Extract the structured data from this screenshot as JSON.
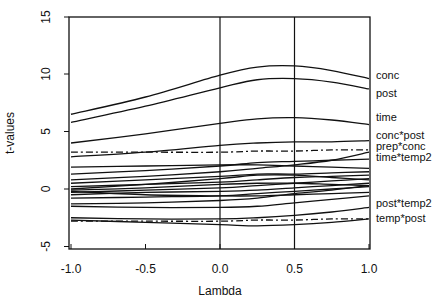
{
  "chart_data": {
    "type": "line",
    "title": "",
    "xlabel": "Lambda",
    "ylabel": "t-values",
    "xlim": [
      -1.0,
      1.0
    ],
    "ylim": [
      -5.3,
      15
    ],
    "xticks": [
      -1.0,
      -0.5,
      0.0,
      0.5,
      1.0
    ],
    "xtick_labels": [
      "-1.0",
      "-0.5",
      "0.0",
      "0.5",
      "1.0"
    ],
    "yticks": [
      -5,
      0,
      5,
      10,
      15
    ],
    "ytick_labels": [
      "-5",
      "0",
      "5",
      "10",
      "15"
    ],
    "vertical_reference_lines": [
      0.0,
      0.5
    ],
    "grid": false,
    "legend": "direct labels at right edge",
    "x": [
      -1.0,
      -0.5,
      0.0,
      0.25,
      0.5,
      0.75,
      1.0
    ],
    "series": [
      {
        "name": "conc",
        "style": "solid",
        "labeled": true,
        "values": [
          6.5,
          8.0,
          9.9,
          10.6,
          10.7,
          10.3,
          9.6
        ]
      },
      {
        "name": "post",
        "style": "solid",
        "labeled": true,
        "values": [
          5.8,
          7.2,
          8.8,
          9.5,
          9.6,
          9.3,
          8.7
        ]
      },
      {
        "name": "time",
        "style": "solid",
        "labeled": true,
        "values": [
          4.0,
          4.8,
          5.7,
          6.1,
          6.2,
          6.0,
          5.6
        ]
      },
      {
        "name": "conc*post",
        "style": "solid",
        "labeled": true,
        "values": [
          2.8,
          3.2,
          3.8,
          4.0,
          4.1,
          4.1,
          4.2
        ]
      },
      {
        "name": "prep*conc",
        "style": "dashdot",
        "labeled": true,
        "values": [
          3.2,
          3.2,
          3.2,
          3.3,
          3.3,
          3.4,
          3.4
        ]
      },
      {
        "name": "time*temp2",
        "style": "solid",
        "labeled": true,
        "values": [
          1.3,
          1.6,
          2.0,
          2.3,
          2.4,
          2.5,
          2.6
        ]
      },
      {
        "name": "unlabeled-1",
        "style": "solid",
        "labeled": false,
        "values": [
          1.9,
          2.0,
          2.1,
          2.1,
          2.0,
          1.9,
          1.8
        ]
      },
      {
        "name": "unlabeled-2",
        "style": "solid",
        "labeled": false,
        "values": [
          0.8,
          1.1,
          1.5,
          1.8,
          2.1,
          2.5,
          3.2
        ]
      },
      {
        "name": "unlabeled-3",
        "style": "solid",
        "labeled": false,
        "values": [
          0.5,
          0.8,
          1.1,
          1.3,
          1.3,
          1.4,
          1.5
        ]
      },
      {
        "name": "unlabeled-4",
        "style": "solid",
        "labeled": false,
        "values": [
          0.2,
          0.4,
          0.6,
          0.8,
          1.0,
          1.1,
          1.2
        ]
      },
      {
        "name": "unlabeled-5",
        "style": "solid",
        "labeled": false,
        "values": [
          0.0,
          0.4,
          0.9,
          1.2,
          1.2,
          1.0,
          0.8
        ]
      },
      {
        "name": "unlabeled-6",
        "style": "solid",
        "labeled": false,
        "values": [
          -0.1,
          0.1,
          0.4,
          0.5,
          0.5,
          0.4,
          0.3
        ]
      },
      {
        "name": "unlabeled-7",
        "style": "solid",
        "labeled": false,
        "values": [
          -0.3,
          -0.1,
          0.1,
          0.3,
          0.5,
          0.7,
          0.9
        ]
      },
      {
        "name": "unlabeled-8",
        "style": "solid",
        "labeled": false,
        "values": [
          -0.5,
          -0.3,
          -0.2,
          -0.1,
          0.1,
          0.3,
          0.5
        ]
      },
      {
        "name": "unlabeled-9",
        "style": "solid",
        "labeled": false,
        "values": [
          -0.2,
          -0.5,
          -0.6,
          -0.6,
          -0.5,
          -0.4,
          -0.3
        ]
      },
      {
        "name": "unlabeled-10",
        "style": "solid",
        "labeled": false,
        "values": [
          -0.8,
          -0.7,
          -0.6,
          -0.4,
          -0.2,
          0.0,
          0.2
        ]
      },
      {
        "name": "post*temp2",
        "style": "solid",
        "labeled": true,
        "values": [
          -1.3,
          -1.2,
          -1.0,
          -0.8,
          -0.4,
          -0.1,
          0.3
        ]
      },
      {
        "name": "unlabeled-11",
        "style": "solid",
        "labeled": false,
        "values": [
          -1.5,
          -1.6,
          -1.6,
          -1.5,
          -1.2,
          -0.9,
          -0.6
        ]
      },
      {
        "name": "unlabeled-12",
        "style": "solid",
        "labeled": false,
        "values": [
          -2.5,
          -2.6,
          -2.6,
          -2.5,
          -2.3,
          -2.0,
          -1.6
        ]
      },
      {
        "name": "temp*post",
        "style": "dashdot",
        "labeled": true,
        "values": [
          -2.8,
          -2.8,
          -2.8,
          -2.7,
          -2.7,
          -2.6,
          -2.6
        ]
      },
      {
        "name": "unlabeled-13",
        "style": "solid",
        "labeled": false,
        "values": [
          -2.7,
          -2.9,
          -3.1,
          -3.2,
          -3.1,
          -2.9,
          -2.6
        ]
      }
    ]
  },
  "labels": {
    "xlabel": "Lambda",
    "ylabel": "t-values"
  }
}
